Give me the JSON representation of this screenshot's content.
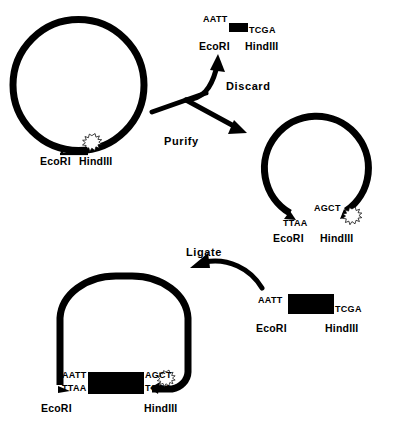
{
  "figure": {
    "background_color": "#ffffff",
    "ink_color": "#000000",
    "width": 399,
    "height": 429
  },
  "enzymes": {
    "ecori": "EcoRI",
    "hindiii": "HindIII"
  },
  "steps": {
    "discard": "Discard",
    "purify": "Purify",
    "ligate": "Ligate"
  },
  "stage_1_cut_plasmid": {
    "name": "Plasmid cut with EcoRI and HindIII",
    "site_label_ecori": "EcoRI",
    "site_label_hindiii": "HindIII",
    "shape": "closed-circle"
  },
  "stage_2_discarded_fragment": {
    "name": "Small excised stuffer fragment to discard",
    "left_overhang": "AATT",
    "right_overhang": "TCGA",
    "left_enzyme": "EcoRI",
    "right_enzyme": "HindIII"
  },
  "stage_3_purified_vector": {
    "name": "Purified linearised vector backbone",
    "left_overhang": "TTAA",
    "right_overhang": "AGCT",
    "left_enzyme": "EcoRI",
    "right_enzyme": "HindIII",
    "shape": "open-circle"
  },
  "stage_4_insert_fragment": {
    "name": "Insert DNA fragment with compatible sticky ends",
    "left_overhang": "AATT",
    "right_overhang": "TCGA",
    "left_enzyme": "EcoRI",
    "right_enzyme": "HindIII"
  },
  "stage_5_recombinant_plasmid": {
    "name": "Recombinant plasmid after ligation",
    "left_junction_top": "AATT",
    "left_junction_bottom": "TTAA",
    "right_junction_top": "AGCT",
    "right_junction_bottom": "TCGA",
    "left_enzyme": "EcoRI",
    "right_enzyme": "HindIII",
    "shape": "closed-oval"
  }
}
